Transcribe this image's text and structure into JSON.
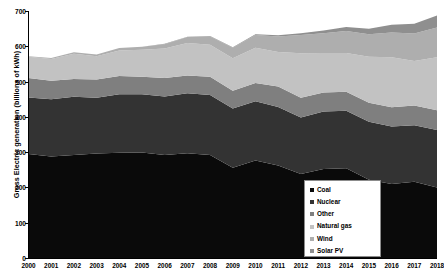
{
  "chart_data": {
    "type": "area",
    "title": "",
    "xlabel": "",
    "ylabel": "Gross Electric generation (billions of kWh)",
    "ylim": [
      0,
      700
    ],
    "yticks": [
      0,
      100,
      200,
      300,
      400,
      500,
      600,
      700
    ],
    "grid": false,
    "stacked": true,
    "legend_position": "lower-right",
    "categories": [
      "2000",
      "2001",
      "2002",
      "2003",
      "2004",
      "2005",
      "2006",
      "2007",
      "2008",
      "2009",
      "2010",
      "2011",
      "2012",
      "2013",
      "2014",
      "2015",
      "2016",
      "2017",
      "2018"
    ],
    "series": [
      {
        "name": "Coal",
        "color": "#0a0a0a",
        "values": [
          295,
          288,
          292,
          296,
          298,
          299,
          292,
          297,
          292,
          256,
          276,
          262,
          238,
          252,
          254,
          222,
          210,
          216,
          200
        ]
      },
      {
        "name": "Nuclear",
        "color": "#333333",
        "values": [
          160,
          162,
          165,
          158,
          166,
          165,
          166,
          170,
          170,
          168,
          168,
          166,
          160,
          163,
          163,
          164,
          163,
          160,
          163
        ]
      },
      {
        "name": "Other",
        "color": "#7f7f7f",
        "values": [
          55,
          52,
          50,
          52,
          52,
          50,
          52,
          50,
          52,
          50,
          52,
          58,
          56,
          54,
          54,
          54,
          54,
          56,
          56
        ]
      },
      {
        "name": "Natural gas",
        "color": "#c2c2c2",
        "values": [
          60,
          62,
          72,
          66,
          72,
          76,
          84,
          92,
          90,
          92,
          100,
          98,
          126,
          112,
          110,
          130,
          142,
          126,
          150
        ]
      },
      {
        "name": "Wind",
        "color": "#aeaeae",
        "values": [
          2,
          3,
          4,
          5,
          7,
          9,
          12,
          17,
          24,
          30,
          36,
          44,
          52,
          56,
          62,
          64,
          70,
          78,
          84
        ]
      },
      {
        "name": "Solar PV",
        "color": "#8f8f8f",
        "values": [
          0,
          0,
          0,
          0,
          0,
          0,
          1,
          1,
          1,
          1,
          2,
          3,
          5,
          8,
          12,
          16,
          22,
          28,
          34
        ]
      }
    ]
  },
  "axis": {
    "y_title": "Gross Electric generation (billions of kWh)",
    "y_tick_labels": [
      "0",
      "100",
      "200",
      "300",
      "400",
      "500",
      "600",
      "700"
    ],
    "x_tick_labels": [
      "2000",
      "2001",
      "2002",
      "2003",
      "2004",
      "2005",
      "2006",
      "2007",
      "2008",
      "2009",
      "2010",
      "2011",
      "2012",
      "2013",
      "2014",
      "2015",
      "2016",
      "2017",
      "2018"
    ]
  },
  "legend": {
    "items": [
      {
        "label": "Coal",
        "color": "#0a0a0a"
      },
      {
        "label": "Nuclear",
        "color": "#333333"
      },
      {
        "label": "Other",
        "color": "#7f7f7f"
      },
      {
        "label": "Natural gas",
        "color": "#c2c2c2"
      },
      {
        "label": "Wind",
        "color": "#aeaeae"
      },
      {
        "label": "Solar PV",
        "color": "#8f8f8f"
      }
    ]
  }
}
